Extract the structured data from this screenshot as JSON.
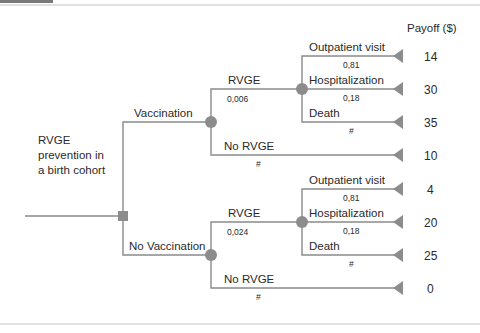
{
  "root": {
    "label_lines": [
      "RVGE",
      "prevention in",
      "a birth cohort"
    ],
    "node_type": "decision"
  },
  "payoff_header": "Payoff ($)",
  "strategies": [
    {
      "label": "Vaccination",
      "node_type": "chance",
      "branches": [
        {
          "label": "RVGE",
          "probability": "0,006",
          "node_type": "chance",
          "outcomes": [
            {
              "label": "Outpatient visit",
              "probability": "0,81",
              "payoff": "14"
            },
            {
              "label": "Hospitalization",
              "probability": "0,18",
              "payoff": "30"
            },
            {
              "label": "Death",
              "probability": "#",
              "payoff": "35"
            }
          ]
        },
        {
          "label": "No RVGE",
          "probability": "#",
          "payoff": "10"
        }
      ]
    },
    {
      "label": "No Vaccination",
      "node_type": "chance",
      "branches": [
        {
          "label": "RVGE",
          "probability": "0,024",
          "node_type": "chance",
          "outcomes": [
            {
              "label": "Outpatient visit",
              "probability": "0,81",
              "payoff": "4"
            },
            {
              "label": "Hospitalization",
              "probability": "0,18",
              "payoff": "20"
            },
            {
              "label": "Death",
              "probability": "#",
              "payoff": "25"
            }
          ]
        },
        {
          "label": "No RVGE",
          "probability": "#",
          "payoff": "0"
        }
      ]
    }
  ],
  "colors": {
    "line": "#8a8a8a",
    "node": "#8c8c8c",
    "text": "#2a2a2a",
    "border": "#bdbdbd",
    "top_bar": "#6e6e6e"
  }
}
